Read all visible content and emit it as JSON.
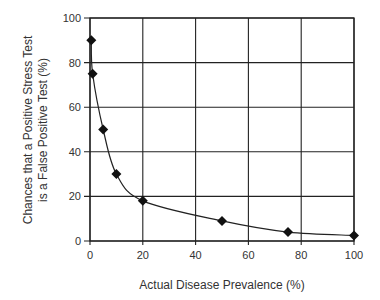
{
  "chart_data": {
    "type": "line",
    "title": "",
    "xlabel": "Actual Disease Prevalence (%)",
    "ylabel_lines": [
      "Chances that a Positive Stress Test",
      "is a False Positive Test (%)"
    ],
    "ylabel": "Chances that a Positive Stress Test is a False Positive Test (%)",
    "xlim": [
      0,
      100
    ],
    "ylim": [
      0,
      100
    ],
    "x_ticks": [
      0,
      20,
      40,
      60,
      80,
      100
    ],
    "y_ticks": [
      0,
      20,
      40,
      60,
      80,
      100
    ],
    "grid": true,
    "legend": null,
    "marker": "diamond",
    "series": [
      {
        "name": "False positive chance",
        "x": [
          0.5,
          1,
          5,
          10,
          20,
          50,
          75,
          100
        ],
        "y": [
          90,
          75,
          50,
          30,
          18,
          9,
          4,
          2.5
        ]
      }
    ]
  }
}
